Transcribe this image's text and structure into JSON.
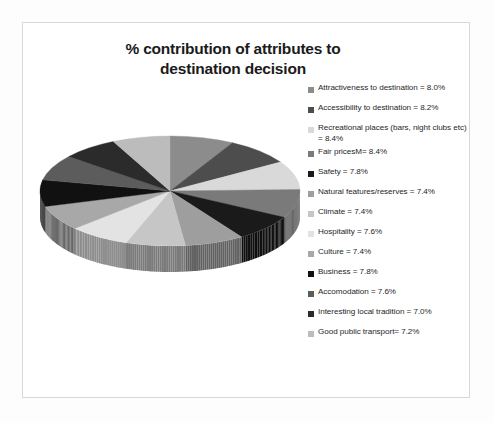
{
  "chart_data": {
    "type": "pie",
    "title": "% contribution of attributes to destination decision",
    "title_line1": "% contribution of attributes to",
    "title_line2": "destination decision",
    "unit": "%",
    "three_d": true,
    "legend_position": "right",
    "categories": [
      "Attractiveness to destination",
      "Accessibility to destination",
      "Recreational places (bars, night clubs etc)",
      "Fair pricesM",
      "Safety",
      "Natural features/reserves",
      "Climate",
      "Hospitality",
      "Culture",
      "Business",
      "Accomodation",
      "Interesting local tradition",
      "Good public transport"
    ],
    "values": [
      8.0,
      8.2,
      8.4,
      8.4,
      7.8,
      7.4,
      7.4,
      7.6,
      7.4,
      7.8,
      7.6,
      7.0,
      7.2
    ],
    "colors": [
      "#8c8c8c",
      "#4d4d4d",
      "#d9d9d9",
      "#7a7a7a",
      "#1a1a1a",
      "#9e9e9e",
      "#c6c6c6",
      "#e3e3e3",
      "#a8a8a8",
      "#111111",
      "#5c5c5c",
      "#2b2b2b",
      "#bcbcbc"
    ]
  },
  "legend": {
    "items": [
      {
        "label": "Attractiveness to destination = 8.0%",
        "color": "#8c8c8c"
      },
      {
        "label": "Accessibility to destination =  8.2%",
        "color": "#4d4d4d"
      },
      {
        "label": "Recreational places (bars, night clubs etc) = 8.4%",
        "color": "#d9d9d9"
      },
      {
        "label": "Fair pricesM= 8.4%",
        "color": "#7a7a7a"
      },
      {
        "label": "Safety = 7.8%",
        "color": "#1a1a1a"
      },
      {
        "label": "Natural features/reserves  = 7.4%",
        "color": "#9e9e9e"
      },
      {
        "label": "Climate = 7.4%",
        "color": "#c6c6c6"
      },
      {
        "label": "Hospitality = 7.6%",
        "color": "#e3e3e3"
      },
      {
        "label": "Culture = 7.4%",
        "color": "#a8a8a8"
      },
      {
        "label": "Business = 7.8%",
        "color": "#111111"
      },
      {
        "label": "Accomodation = 7.6%",
        "color": "#5c5c5c"
      },
      {
        "label": "Interesting local tradition = 7.0%",
        "color": "#2b2b2b"
      },
      {
        "label": "Good public transport= 7.2%",
        "color": "#bcbcbc"
      }
    ]
  }
}
